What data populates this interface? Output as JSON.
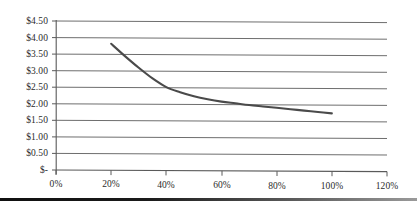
{
  "chart_data": {
    "type": "line",
    "title": "",
    "subtitle": "",
    "xlabel": "",
    "ylabel": "",
    "xlim": [
      0,
      120
    ],
    "ylim": [
      0,
      4.5
    ],
    "grid": "horizontal",
    "legend": "none",
    "x_tick_labels": [
      "0%",
      "20%",
      "40%",
      "60%",
      "80%",
      "100%",
      "120%"
    ],
    "x_tick_values": [
      0,
      20,
      40,
      60,
      80,
      100,
      120
    ],
    "y_tick_labels": [
      "$4.50",
      "$4.00",
      "$3.50",
      "$3.00",
      "$2.50",
      "$2.00",
      "$1.50",
      "$1.00",
      "$0.50",
      "$-"
    ],
    "y_tick_values": [
      4.5,
      4.0,
      3.5,
      3.0,
      2.5,
      2.0,
      1.5,
      1.0,
      0.5,
      0.0
    ],
    "series": [
      {
        "name": "",
        "color": "#4a4a4a",
        "x": [
          20,
          25,
          30,
          35,
          40,
          45,
          50,
          55,
          60,
          65,
          70,
          75,
          80,
          85,
          90,
          95,
          100
        ],
        "values": [
          3.82,
          3.45,
          3.1,
          2.78,
          2.52,
          2.37,
          2.25,
          2.16,
          2.09,
          2.04,
          1.99,
          1.95,
          1.91,
          1.87,
          1.83,
          1.79,
          1.75
        ]
      }
    ]
  },
  "axis": {
    "y_labels": [
      {
        "text": "$4.50",
        "top": 16
      },
      {
        "text": "$4.00",
        "top": 33
      },
      {
        "text": "$3.50",
        "top": 49
      },
      {
        "text": "$3.00",
        "top": 66
      },
      {
        "text": "$2.50",
        "top": 82
      },
      {
        "text": "$2.00",
        "top": 99
      },
      {
        "text": "$1.50",
        "top": 115
      },
      {
        "text": "$1.00",
        "top": 132
      },
      {
        "text": "$0.50",
        "top": 148
      },
      {
        "text": "$-",
        "top": 165
      }
    ],
    "x_labels": [
      {
        "text": "0%",
        "left": 36
      },
      {
        "text": "20%",
        "left": 91
      },
      {
        "text": "40%",
        "left": 146
      },
      {
        "text": "60%",
        "left": 202
      },
      {
        "text": "80%",
        "left": 257
      },
      {
        "text": "100%",
        "left": 312
      },
      {
        "text": "120%",
        "left": 367
      }
    ]
  },
  "colors": {
    "grid": "#6e6e6e",
    "axis": "#5a5a5a",
    "series": "#4a4a4a",
    "text": "#2b2b2b",
    "rule": "#101010",
    "background": "#ffffff"
  }
}
